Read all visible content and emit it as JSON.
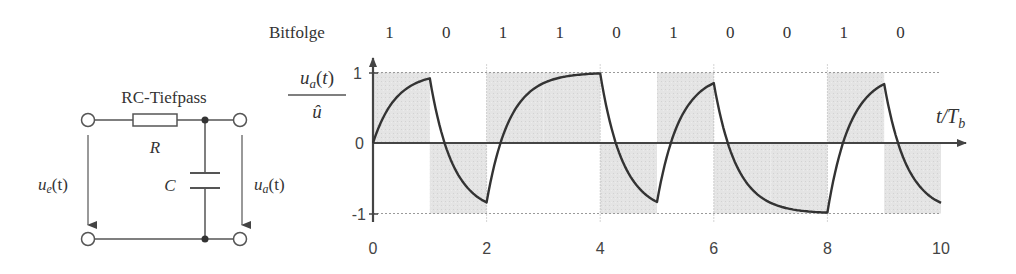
{
  "circuit": {
    "title": "RC-Tiefpass",
    "resistor_label": "R",
    "capacitor_label": "C",
    "input_voltage_label": "u",
    "input_voltage_sub": "e",
    "input_voltage_arg": "(t)",
    "output_voltage_label": "u",
    "output_voltage_sub": "a",
    "output_voltage_arg": "(t)"
  },
  "header": {
    "bit_sequence_label": "Bitfolge",
    "bits": [
      "1",
      "0",
      "1",
      "1",
      "0",
      "1",
      "0",
      "0",
      "1",
      "0"
    ]
  },
  "chart_data": {
    "type": "line",
    "title": "",
    "ylabel_numerator": "u_a(t)",
    "ylabel_denominator": "û",
    "xlabel": "t/T_b",
    "xlim": [
      0,
      10
    ],
    "ylim": [
      -1,
      1
    ],
    "x_ticks": [
      "0",
      "2",
      "4",
      "6",
      "8",
      "10"
    ],
    "y_ticks": [
      "1",
      "0",
      "-1"
    ],
    "grid": "dotted at y=±1 and even x",
    "input_signal": {
      "name": "Eingangssignal (schattiert)",
      "bits": [
        1,
        0,
        1,
        1,
        0,
        1,
        0,
        0,
        1,
        0
      ],
      "levels": [
        1,
        -1,
        1,
        1,
        -1,
        1,
        -1,
        -1,
        1,
        -1
      ]
    },
    "series": [
      {
        "name": "u_a(t)/û",
        "x": [
          0,
          1,
          2,
          3,
          4,
          5,
          6,
          7,
          8,
          9,
          10
        ],
        "values": [
          0,
          0.92,
          -0.85,
          0.85,
          0.99,
          -0.86,
          0.84,
          -0.86,
          -0.99,
          0.86,
          -0.85
        ]
      }
    ],
    "time_constant_estimate": 0.4
  },
  "colors": {
    "line": "#333333",
    "shade": "#e2e2e2",
    "grid": "#9a9a9a"
  }
}
